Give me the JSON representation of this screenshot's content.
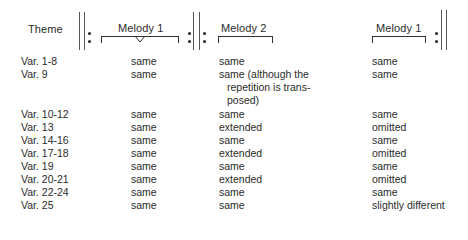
{
  "header": {
    "theme": "Theme",
    "section1": "Melody 1",
    "section2": "Melody 2",
    "section3": "Melody 1"
  },
  "symbols": {
    "start_repeat_1": "double-barline-repeat-start",
    "end_start_repeat": "repeat-end-start",
    "end_repeat": "repeat-end"
  },
  "rows": [
    {
      "label": "Var.  1-8",
      "m1": "same",
      "m2": [
        "same"
      ],
      "m1b": "same"
    },
    {
      "label": "Var.  9",
      "m1": "same",
      "m2": [
        "same (although the",
        "repetition is trans-",
        "posed)"
      ],
      "m1b": "same"
    },
    {
      "label": "Var. 10-12",
      "m1": "same",
      "m2": [
        "same"
      ],
      "m1b": "same"
    },
    {
      "label": "Var. 13",
      "m1": "same",
      "m2": [
        "extended"
      ],
      "m1b": "omitted"
    },
    {
      "label": "Var. 14-16",
      "m1": "same",
      "m2": [
        "same"
      ],
      "m1b": "same"
    },
    {
      "label": "Var. 17-18",
      "m1": "same",
      "m2": [
        "extended"
      ],
      "m1b": "omitted"
    },
    {
      "label": "Var. 19",
      "m1": "same",
      "m2": [
        "same"
      ],
      "m1b": "same"
    },
    {
      "label": "Var. 20-21",
      "m1": "same",
      "m2": [
        "extended"
      ],
      "m1b": "omitted"
    },
    {
      "label": "Var. 22-24",
      "m1": "same",
      "m2": [
        "same"
      ],
      "m1b": "same"
    },
    {
      "label": "Var. 25",
      "m1": "same",
      "m2": [
        "same"
      ],
      "m1b": "slightly different"
    }
  ]
}
